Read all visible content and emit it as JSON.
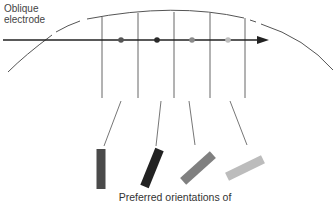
{
  "diagram": {
    "electrode_label_line1": "Oblique",
    "electrode_label_line2": "electrode",
    "caption": "Preferred orientations of",
    "colors": {
      "arc": "#555555",
      "axis": "#222222",
      "column_lines": "#666666",
      "leader_lines": "#666666"
    },
    "column_boundaries_x": [
      102,
      138,
      174,
      210,
      245
    ],
    "recording_points": [
      {
        "x": 121,
        "color": "#555555"
      },
      {
        "x": 157,
        "color": "#2a2a2a"
      },
      {
        "x": 192,
        "color": "#8a8a8a"
      },
      {
        "x": 228,
        "color": "#bdbdbd"
      }
    ],
    "orientation_bars": [
      {
        "cx": 101,
        "cy": 169,
        "angle_deg": 0,
        "color": "#4a4a4a"
      },
      {
        "cx": 152,
        "cy": 168,
        "angle_deg": 22,
        "color": "#222222"
      },
      {
        "cx": 198,
        "cy": 168,
        "angle_deg": 48,
        "color": "#808080"
      },
      {
        "cx": 245,
        "cy": 168,
        "angle_deg": 64,
        "color": "#bcbcbc"
      }
    ]
  }
}
